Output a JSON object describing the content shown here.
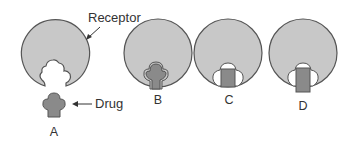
{
  "labels": {
    "receptor": "Receptor",
    "drug": "Drug"
  },
  "panels": [
    {
      "id": "A",
      "label": "A",
      "state": "drug separated from receptor, complementary shape"
    },
    {
      "id": "B",
      "label": "B",
      "state": "drug fits exactly in receptor pocket"
    },
    {
      "id": "C",
      "label": "C",
      "state": "rectangular drug partially fits"
    },
    {
      "id": "D",
      "label": "D",
      "state": "taller rectangular drug partially fits"
    }
  ],
  "colors": {
    "receptor_fill": "#c8c8c8",
    "drug_fill": "#8a8a8a",
    "outline": "#555555",
    "pocket": "#ffffff",
    "text": "#333333"
  }
}
